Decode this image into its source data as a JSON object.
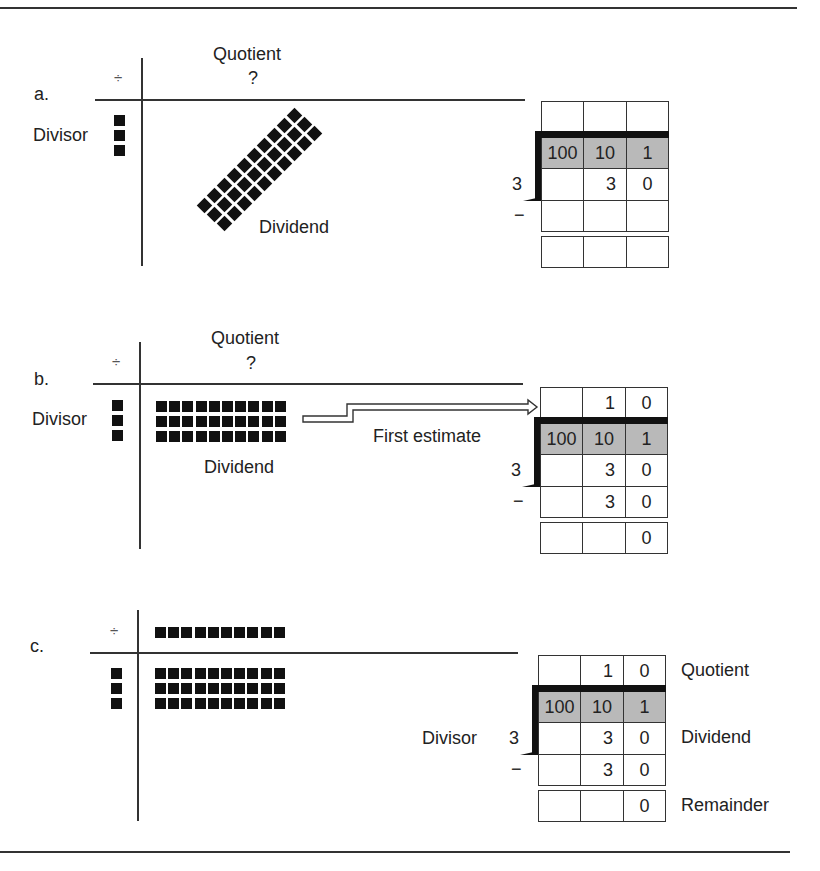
{
  "figure": {
    "panels": [
      {
        "id": "a",
        "letter": "a.",
        "division_sign": "÷",
        "quotient_label": "Quotient",
        "quotient_value": "?",
        "divisor_label": "Divisor",
        "dividend_label": "Dividend",
        "divisor_count": 3,
        "dividend_arrangement": "diagonal",
        "dividend_rows": 3,
        "dividend_cols": 10,
        "grid": {
          "headers": [
            "100",
            "10",
            "1"
          ],
          "divisor": "3",
          "minus": "−",
          "rows": [
            [
              "",
              "",
              ""
            ],
            [
              "",
              "3",
              "0"
            ],
            [
              "",
              "",
              ""
            ],
            [
              "",
              "",
              ""
            ]
          ]
        }
      },
      {
        "id": "b",
        "letter": "b.",
        "division_sign": "÷",
        "quotient_label": "Quotient",
        "quotient_value": "?",
        "divisor_label": "Divisor",
        "dividend_label": "Dividend",
        "arrow_label": "First estimate",
        "divisor_count": 3,
        "dividend_arrangement": "rows",
        "dividend_rows": 3,
        "dividend_cols": 10,
        "grid": {
          "headers": [
            "100",
            "10",
            "1"
          ],
          "divisor": "3",
          "minus": "−",
          "rows": [
            [
              "",
              "1",
              "0"
            ],
            [
              "",
              "3",
              "0"
            ],
            [
              "",
              "3",
              "0"
            ],
            [
              "",
              "",
              "0"
            ]
          ]
        }
      },
      {
        "id": "c",
        "letter": "c.",
        "division_sign": "÷",
        "divisor_label": "Divisor",
        "quotient_row_count": 10,
        "divisor_count": 3,
        "dividend_arrangement": "rows",
        "dividend_rows": 3,
        "dividend_cols": 10,
        "grid": {
          "headers": [
            "100",
            "10",
            "1"
          ],
          "divisor": "3",
          "minus": "−",
          "rows": [
            [
              "",
              "1",
              "0"
            ],
            [
              "",
              "3",
              "0"
            ],
            [
              "",
              "3",
              "0"
            ],
            [
              "",
              "",
              "0"
            ]
          ],
          "row_labels": [
            "Quotient",
            "Dividend",
            "",
            "Remainder"
          ]
        }
      }
    ],
    "colors": {
      "ink": "#111111",
      "shade": "#b9b9b9",
      "rule": "#333333"
    }
  }
}
